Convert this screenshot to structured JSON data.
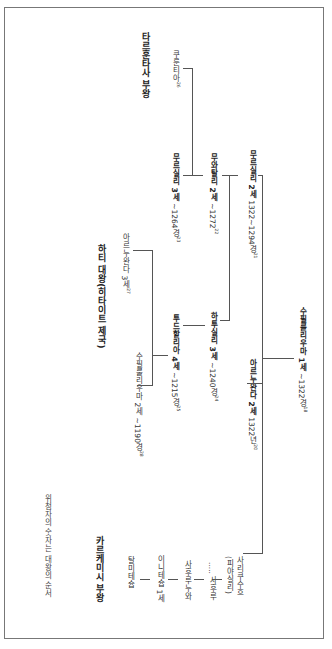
{
  "titles": {
    "tarhuntassa": "타르훈타사 부왕",
    "hatti": "하티 대왕(히타이트 제국)",
    "karkemish": "카르케미시 부왕"
  },
  "note": "위첨자의 숫자는 대왕의 순서",
  "kings": {
    "suppiluliuma1": {
      "name": "수필룰리우마 1세",
      "date": "~1322경",
      "ord": "18"
    },
    "mursili2": {
      "name": "무르실리 2세",
      "date": "1322~1294경",
      "ord": "21"
    },
    "arnuwanda2": {
      "name": "아르누완다 2세",
      "date": "1322년",
      "ord": "20"
    },
    "muwatalli2": {
      "name": "무와탈리 2세",
      "date": "~1272",
      "ord": "22"
    },
    "hattusili3": {
      "name": "하투실리 3세",
      "date": "~1240경",
      "ord": "24"
    },
    "kurunta": {
      "name": "쿠룬티아",
      "date": "",
      "ord": "26"
    },
    "mursili3": {
      "name": "무르실리 3세",
      "date": "~1264경",
      "ord": "23"
    },
    "tudhaliya4": {
      "name": "투드할리아 4세",
      "date": "~1215경",
      "ord": "25"
    },
    "arnuwanda3": {
      "name": "아르누완다 3세",
      "date": "",
      "ord": "27"
    },
    "suppiluliuma2": {
      "name": "수필룰리우마 2세",
      "date": "~1190경",
      "ord": "28"
    }
  },
  "karkemish_line": [
    {
      "name": "사리쿠수흐",
      "alt": "(피야실리)"
    },
    {
      "name": "..... 사후루"
    },
    {
      "name": "사후루누와"
    },
    {
      "name": "이니테슙 1세"
    },
    {
      "name": "탈미테슙"
    }
  ]
}
